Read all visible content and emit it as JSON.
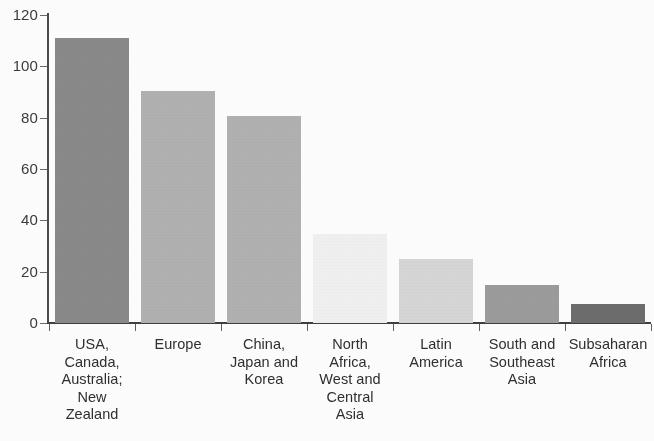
{
  "chart_data": {
    "type": "bar",
    "title": "",
    "subtitle": "",
    "xlabel": "",
    "ylabel": "",
    "ylim": [
      0,
      120
    ],
    "ytick_step": 20,
    "ytick_labels": [
      "120",
      "100",
      "80",
      "60",
      "40",
      "20",
      "0"
    ],
    "ytick_values": [
      120,
      100,
      80,
      60,
      40,
      20,
      0
    ],
    "grid": false,
    "legend": null,
    "categories": [
      "USA,\nCanada,\nAustralia;\nNew\nZealand",
      "Europe",
      "China,\nJapan and\nKorea",
      "North\nAfrica,\nWest and\nCentral\nAsia",
      "Latin\nAmerica",
      "South and\nSoutheast\nAsia",
      "Subsaharan\nAfrica"
    ],
    "categories_flat": [
      "USA, Canada, Australia; New Zealand",
      "Europe",
      "China, Japan and Korea",
      "North Africa, West and Central Asia",
      "Latin America",
      "South and Southeast Asia",
      "Subsaharan Africa"
    ],
    "values": [
      111,
      90.5,
      80.5,
      34.5,
      25,
      15,
      7.5
    ],
    "bar_colors": [
      "#8a8a8a",
      "#b2b2b2",
      "#b2b2b2",
      "#f1f1f1",
      "#d7d7d7",
      "#9c9c9c",
      "#6d6d6d"
    ],
    "axis_color": "#3f3f3f",
    "text_color": "#2f2f2f",
    "background": "#fdfdfd"
  }
}
